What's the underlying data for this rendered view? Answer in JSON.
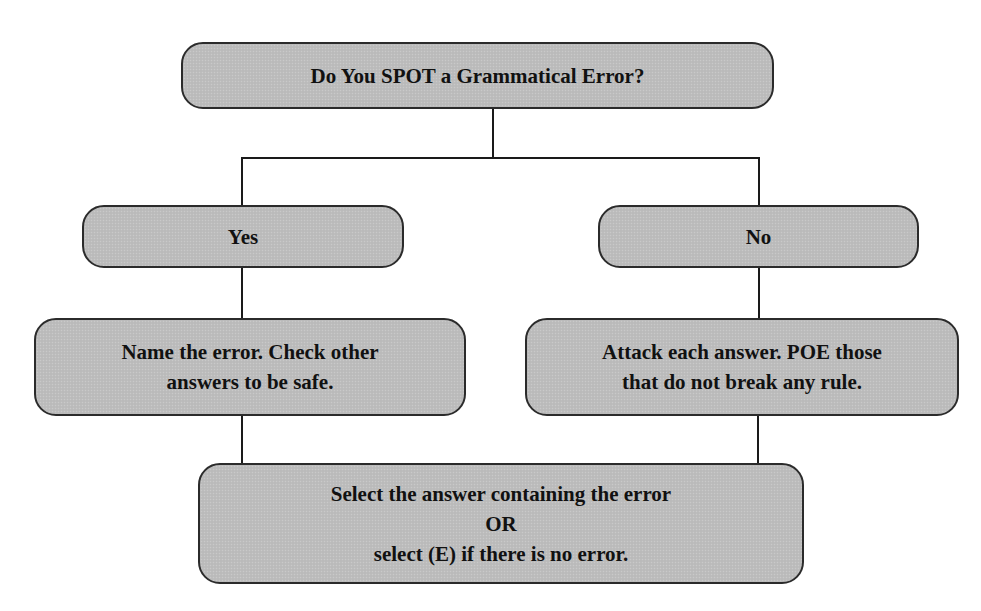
{
  "diagram": {
    "type": "flowchart",
    "colors": {
      "box_fill": "#bdbdbd",
      "box_border": "#2b2b2b",
      "line": "#1a1a1a",
      "text": "#111111"
    },
    "nodes": {
      "question": {
        "lines": [
          "Do You SPOT a Grammatical Error?"
        ]
      },
      "yes": {
        "lines": [
          "Yes"
        ]
      },
      "no": {
        "lines": [
          "No"
        ]
      },
      "yes_action": {
        "lines": [
          "Name the error. Check other",
          "answers to be safe."
        ]
      },
      "no_action": {
        "lines": [
          "Attack each answer. POE those",
          "that do not break any rule."
        ]
      },
      "final": {
        "lines": [
          "Select the answer containing the error",
          "OR",
          "select (E) if there is no error."
        ]
      }
    },
    "edges": [
      {
        "from": "question",
        "to": "yes"
      },
      {
        "from": "question",
        "to": "no"
      },
      {
        "from": "yes",
        "to": "yes_action"
      },
      {
        "from": "no",
        "to": "no_action"
      },
      {
        "from": "yes_action",
        "to": "final"
      },
      {
        "from": "no_action",
        "to": "final"
      }
    ]
  }
}
